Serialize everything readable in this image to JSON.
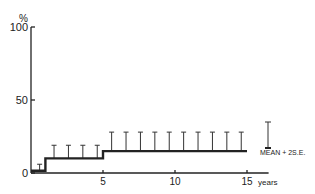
{
  "chart_data": {
    "type": "line",
    "subtype": "step-with-error-bars",
    "title": "",
    "ylabel": "%",
    "xlabel": "years",
    "ylim": [
      0,
      100
    ],
    "xlim": [
      0,
      15
    ],
    "yticks": [
      0,
      50,
      100
    ],
    "ytick_labels": [
      "0",
      "50",
      "100"
    ],
    "xticks": [
      5,
      10,
      15
    ],
    "xtick_labels": [
      "5",
      "10",
      "15"
    ],
    "grid": false,
    "series": [
      {
        "name": "Mean",
        "steps": [
          {
            "x_start": 0,
            "x_end": 1,
            "y": 1.5
          },
          {
            "x_start": 1,
            "x_end": 5,
            "y": 10
          },
          {
            "x_start": 5,
            "x_end": 15,
            "y": 15
          }
        ]
      },
      {
        "name": "Mean + 2 S.E.",
        "error_bars": [
          {
            "x": 0.6,
            "y": 1.5,
            "upper": 6
          },
          {
            "x": 1.6,
            "y": 10,
            "upper": 19
          },
          {
            "x": 2.6,
            "y": 10,
            "upper": 19
          },
          {
            "x": 3.6,
            "y": 10,
            "upper": 19
          },
          {
            "x": 4.6,
            "y": 10,
            "upper": 19
          },
          {
            "x": 5.6,
            "y": 15,
            "upper": 28
          },
          {
            "x": 6.6,
            "y": 15,
            "upper": 28
          },
          {
            "x": 7.6,
            "y": 15,
            "upper": 28
          },
          {
            "x": 8.6,
            "y": 15,
            "upper": 28
          },
          {
            "x": 9.6,
            "y": 15,
            "upper": 28
          },
          {
            "x": 10.6,
            "y": 15,
            "upper": 28
          },
          {
            "x": 11.6,
            "y": 15,
            "upper": 28
          },
          {
            "x": 12.6,
            "y": 15,
            "upper": 28
          },
          {
            "x": 13.6,
            "y": 15,
            "upper": 28
          },
          {
            "x": 14.6,
            "y": 15,
            "upper": 28
          }
        ]
      }
    ],
    "legend": {
      "placement": "right",
      "label": "MEAN + 2S.E."
    }
  }
}
